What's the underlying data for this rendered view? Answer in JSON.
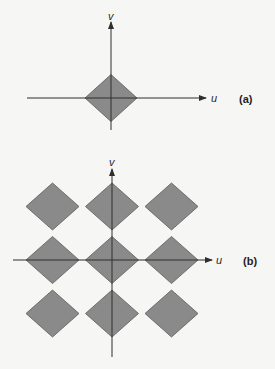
{
  "panels": [
    {
      "id": "a",
      "panel_label": "(a)",
      "u_label": "u",
      "v_label": "v",
      "description": "single diamond centered at origin",
      "diamonds": [
        [
          0,
          0
        ]
      ]
    },
    {
      "id": "b",
      "panel_label": "(b)",
      "u_label": "u",
      "v_label": "v",
      "description": "3x3 periodic array of diamonds centered at origin",
      "diamonds": [
        [
          -1,
          1
        ],
        [
          0,
          1
        ],
        [
          1,
          1
        ],
        [
          -1,
          0
        ],
        [
          0,
          0
        ],
        [
          1,
          0
        ],
        [
          -1,
          -1
        ],
        [
          0,
          -1
        ],
        [
          1,
          -1
        ]
      ]
    }
  ],
  "colors": {
    "diamond_fill": "#8a8a8a",
    "diamond_stroke": "#5c5c5c",
    "axis": "#2e2e2e"
  }
}
